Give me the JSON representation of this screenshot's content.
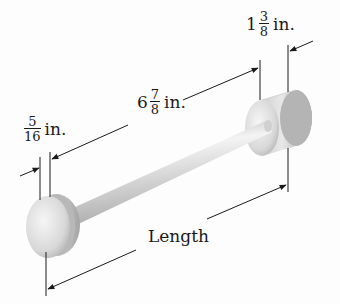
{
  "figure": {
    "type": "dimensioned drawing of a dumbbell-shaped rod",
    "object": "rod with cylindrical end caps",
    "colors": {
      "background": "#fdfdfd",
      "line": "#1a1a1a",
      "metal_light": "#f2f2f2",
      "metal_mid": "#c8c8c8",
      "metal_dark": "#9a9a9a"
    }
  },
  "dimensions": {
    "left_cap": {
      "whole": "",
      "numerator": "5",
      "denominator": "16",
      "unit": "in."
    },
    "rod": {
      "whole": "6",
      "numerator": "7",
      "denominator": "8",
      "unit": "in."
    },
    "right_cap": {
      "whole": "1",
      "numerator": "3",
      "denominator": "8",
      "unit": "in."
    },
    "overall": {
      "label": "Length"
    }
  }
}
